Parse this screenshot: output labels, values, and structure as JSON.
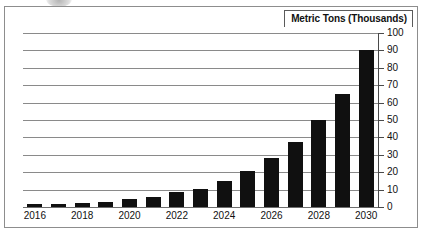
{
  "chart_data": {
    "type": "bar",
    "title": "Metric Tons (Thousands)",
    "xlabel": "",
    "ylabel": "Metric Tons (Thousands)",
    "ylim": [
      0,
      100
    ],
    "ytick_step": 10,
    "yticks": [
      100,
      90,
      80,
      70,
      60,
      50,
      40,
      30,
      20,
      10,
      0
    ],
    "grid": true,
    "legend": "none",
    "bar_color": "#101010",
    "categories": [
      2016,
      2017,
      2018,
      2019,
      2020,
      2021,
      2022,
      2023,
      2024,
      2025,
      2026,
      2027,
      2028,
      2029,
      2030
    ],
    "visible_tick_labels": [
      "2016",
      "2018",
      "2020",
      "2022",
      "2024",
      "2026",
      "2028",
      "2030"
    ],
    "values": [
      2,
      2,
      2.5,
      3,
      4.5,
      6,
      8.5,
      10.5,
      15,
      20.5,
      28,
      37.5,
      50,
      65,
      90
    ]
  },
  "frame": {
    "border_color": "#8d8d8d"
  }
}
